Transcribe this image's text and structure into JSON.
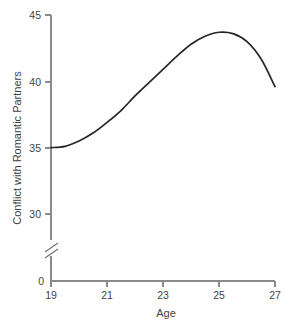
{
  "chart_data": {
    "type": "line",
    "title": "",
    "subtitle": "",
    "xlabel": "Age",
    "ylabel": "Conflict with Romantic Partners",
    "xlim": [
      19,
      27
    ],
    "ylim": [
      29.4,
      45
    ],
    "grid": false,
    "legend": null,
    "axis_break": {
      "axis": "y",
      "between": [
        0,
        30
      ],
      "symbol": "double-slash"
    },
    "xticks": [
      19,
      21,
      23,
      25,
      27
    ],
    "xticklabels": [
      "19",
      "21",
      "23",
      "25",
      "27"
    ],
    "yticks": [
      0,
      30,
      35,
      40,
      45
    ],
    "yticklabels": [
      "0",
      "30",
      "35",
      "40",
      "45"
    ],
    "series": [
      {
        "name": "Conflict with Romantic Partners",
        "color": "#262626",
        "x": [
          19.0,
          19.5,
          20.0,
          20.5,
          21.0,
          21.5,
          22.0,
          22.5,
          23.0,
          23.5,
          24.0,
          24.5,
          25.0,
          25.5,
          26.0,
          26.5,
          27.0
        ],
        "values": [
          35.0,
          35.1,
          35.5,
          36.1,
          36.9,
          37.8,
          38.9,
          39.9,
          40.9,
          41.9,
          42.8,
          43.4,
          43.7,
          43.6,
          43.0,
          41.7,
          39.6
        ]
      }
    ],
    "annotations": []
  },
  "axes": {
    "x_axis_name": "x-axis",
    "y_axis_name": "y-axis"
  }
}
